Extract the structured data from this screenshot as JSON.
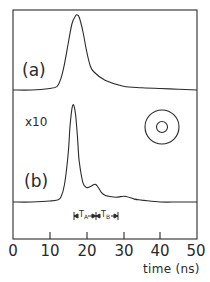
{
  "chart_data": {
    "type": "line",
    "title": "",
    "xlabel": "time (ns)",
    "ylabel": "",
    "xlim": [
      0,
      50
    ],
    "x_ticks": [
      0,
      10,
      20,
      30,
      40,
      50
    ],
    "x_tick_labels": [
      "0",
      "10",
      "20",
      "30",
      "40",
      "50"
    ],
    "grid": false,
    "legend": null,
    "series": [
      {
        "name": "(a)",
        "x": [
          0,
          5,
          10,
          12,
          13,
          14,
          15,
          16,
          17,
          17.5,
          18,
          19,
          20,
          21,
          22,
          25,
          30,
          35,
          40,
          45,
          50
        ],
        "values": [
          0.0,
          0.0,
          0.02,
          0.05,
          0.15,
          0.35,
          0.62,
          0.88,
          0.99,
          1.0,
          0.97,
          0.78,
          0.52,
          0.32,
          0.24,
          0.13,
          0.05,
          0.03,
          0.02,
          0.01,
          0.0
        ],
        "unit": "arb."
      },
      {
        "name": "(b)",
        "scale_label": "x10",
        "x": [
          0,
          5,
          10,
          12,
          13,
          14,
          15,
          15.5,
          16,
          16.5,
          17,
          17.5,
          18,
          19,
          20,
          21,
          22,
          22.5,
          23,
          24,
          25,
          26,
          28,
          30,
          31,
          33,
          35,
          40,
          45,
          50
        ],
        "values": [
          0.0,
          0.0,
          0.01,
          0.02,
          0.05,
          0.18,
          0.5,
          0.78,
          0.96,
          1.0,
          0.9,
          0.68,
          0.42,
          0.2,
          0.15,
          0.16,
          0.18,
          0.18,
          0.16,
          0.1,
          0.07,
          0.06,
          0.05,
          0.06,
          0.055,
          0.03,
          0.02,
          0.0,
          0.0,
          0.0
        ],
        "unit": "arb."
      }
    ],
    "annotations": [
      {
        "text": "T_A",
        "type": "interval",
        "x_start": 16.5,
        "x_end": 22.5
      },
      {
        "text": "T_B",
        "type": "interval",
        "x_start": 22.5,
        "x_end": 28.5
      },
      {
        "text": "x10",
        "target": "(b)"
      },
      {
        "text": "concentric-circles symbol",
        "type": "icon"
      }
    ]
  },
  "labels": {
    "panel_a": "(a)",
    "panel_b": "(b)",
    "scale_b": "x10",
    "xlabel": "time (ns)",
    "ticks": [
      "0",
      "10",
      "20",
      "30",
      "40",
      "50"
    ],
    "ta_main": "T",
    "ta_sub": "A",
    "tb_main": "T",
    "tb_sub": "B"
  }
}
